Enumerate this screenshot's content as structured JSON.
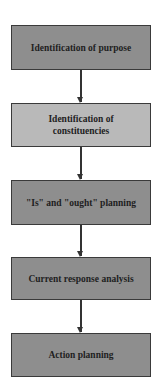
{
  "diagram": {
    "type": "flowchart",
    "direction": "top-to-bottom",
    "steps": [
      {
        "label": "Identification of purpose",
        "shade": "dark"
      },
      {
        "label": "Identification of constituencies",
        "shade": "light"
      },
      {
        "label": "\"Is\" and \"ought\" planning",
        "shade": "dark"
      },
      {
        "label": "Current response analysis",
        "shade": "dark"
      },
      {
        "label": "Action planning",
        "shade": "dark"
      }
    ],
    "colors": {
      "dark": "#8e8e8e",
      "light": "#b9b9b9",
      "border": "#3a3a3a",
      "arrow": "#333333"
    }
  }
}
